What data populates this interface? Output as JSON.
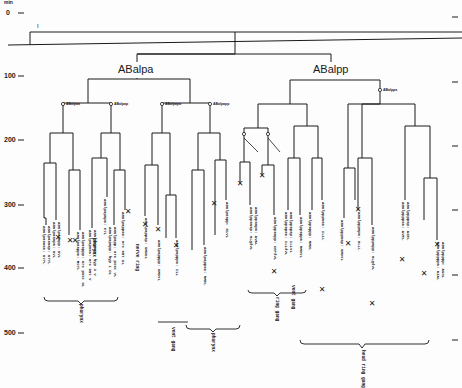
{
  "axis": {
    "unit": "min",
    "ticks": [
      "0",
      "100",
      "200",
      "300",
      "400",
      "500"
    ],
    "marker": "I"
  },
  "branches": {
    "left": "ABalpa",
    "right": "ABalpp"
  },
  "node_labels": {
    "left_1": "ABalpaa",
    "left_2": "ABalpap",
    "left_3": "ABalpapa",
    "left_4": "ABalpapp",
    "right_1": "ABalppa",
    "right_2": "ABalpppa",
    "right_3": "ABalpppp"
  },
  "cells": [
    "ABalpaaaaa: a??L",
    "ABalpaaaap: a??L",
    "ABalpaaapa: aVL",
    "ABalpaaapp: aVL",
    "ABalpaapaa: a?L",
    "ABalpaapap: a?L",
    "ABalpaappa: MC?L",
    "ABalpaappp: arc post DL",
    "ABalpapaaa: arc ant V",
    "ABalpapaap: hyp 3 V",
    "ABalpapapa: e?L",
    "ABalpapapp: hyp 1 DL",
    "ABalpapp: arc post VL",
    "ABalpappaa: arc ant DL",
    "ABalpappap: SMDDL",
    "ABalpapppp: SMDVL",
    "ABalpapppa: I1L",
    "ABalpappaa: RMEL",
    "ABalpaapp: m1VL",
    "ABalppaaap: OLQdVL",
    "ABalppaapa: AVAL",
    "ABalppaapp: CEPdVL",
    "ABalppapaa: IL1dVL",
    "ABalppapap: IL1VL",
    "ABalppappa: RMDVL",
    "ABalppappp: RMDL",
    "ABalpppaaa: IL1L",
    "ABalpppaap: SMDVL",
    "ABalpppapa: OLLL",
    "ABalpppapp: OLQdVL",
    "ABalppppaa: AVEL",
    "ABalppppap: ASEL",
    "ABalpppppa: AIAL",
    "ABalppppp: ASGL"
  ],
  "groups": [
    "pharynx",
    "pharynx",
    "pharynx",
    "nerve ring",
    "vent gang",
    "ring gang",
    "vent gang",
    "head ring gang"
  ],
  "legend_markers": {
    "cell_death": "★",
    "division": "o"
  }
}
